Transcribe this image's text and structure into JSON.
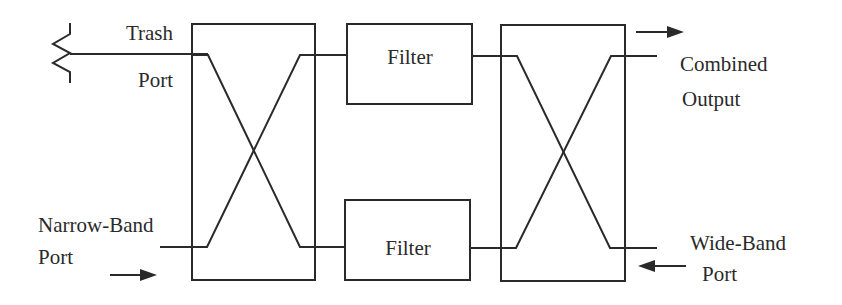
{
  "diagram": {
    "type": "block-diagram",
    "labels": {
      "trash": "Trash",
      "trash_port": "Port",
      "narrow_band": "Narrow-Band",
      "narrow_port": "Port",
      "combined": "Combined",
      "output": "Output",
      "wide_band": "Wide-Band",
      "wide_port": "Port"
    },
    "blocks": [
      {
        "id": "left-coupler",
        "label": ""
      },
      {
        "id": "filter-top",
        "label": "Filter"
      },
      {
        "id": "filter-bottom",
        "label": "Filter"
      },
      {
        "id": "right-coupler",
        "label": ""
      }
    ],
    "terminations": [
      {
        "id": "trash-load",
        "icon": "resistor-icon"
      }
    ],
    "arrows": [
      {
        "id": "narrow-band-input",
        "direction": "right"
      },
      {
        "id": "combined-output",
        "direction": "right"
      },
      {
        "id": "wide-band-input",
        "direction": "left"
      }
    ],
    "colors": {
      "stroke": "#2a2a2a",
      "background": "#ffffff"
    }
  }
}
